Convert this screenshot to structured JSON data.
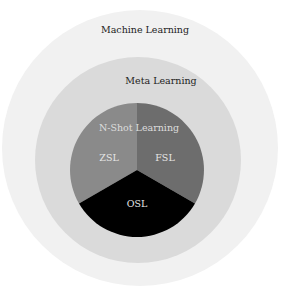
{
  "diagram": {
    "type": "nested-venn",
    "layers": [
      {
        "label": "Machine Learning",
        "color": "#f1f1f1"
      },
      {
        "label": "Meta Learning",
        "color": "#dadada"
      },
      {
        "label": "N-Shot Learning",
        "color": "#808080"
      }
    ],
    "segments": [
      {
        "label": "ZSL",
        "color": "#8a8a8a"
      },
      {
        "label": "FSL",
        "color": "#6d6d6d"
      },
      {
        "label": "OSL",
        "color": "#000000"
      }
    ]
  }
}
